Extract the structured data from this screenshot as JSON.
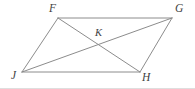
{
  "figure": {
    "background_color": "#ffffff",
    "stroke_color": "#8c8c8c",
    "label_color": "#3f3f3f",
    "stroke_width": 1,
    "width": 195,
    "height": 89
  },
  "labels": {
    "f": "F",
    "g": "G",
    "j": "J",
    "h": "H",
    "k": "K"
  },
  "vertices": {
    "F": {
      "x": 58,
      "y": 18,
      "label": "F",
      "label_x": 49,
      "label_y": 3
    },
    "G": {
      "x": 172,
      "y": 18,
      "label": "G",
      "label_x": 175,
      "label_y": 3
    },
    "J": {
      "x": 22,
      "y": 72,
      "label": "J",
      "label_x": 11,
      "label_y": 71
    },
    "H": {
      "x": 140,
      "y": 72,
      "label": "H",
      "label_x": 142,
      "label_y": 72
    },
    "K": {
      "x": 97,
      "y": 45,
      "label": "K",
      "label_x": 95,
      "label_y": 28
    }
  },
  "segments": [
    {
      "name": "FG",
      "from": "F",
      "to": "G",
      "kind": "side"
    },
    {
      "name": "GH",
      "from": "G",
      "to": "H",
      "kind": "side"
    },
    {
      "name": "HJ",
      "from": "H",
      "to": "J",
      "kind": "side"
    },
    {
      "name": "JF",
      "from": "J",
      "to": "F",
      "kind": "side"
    },
    {
      "name": "FH",
      "from": "F",
      "to": "H",
      "kind": "diagonal"
    },
    {
      "name": "JG",
      "from": "J",
      "to": "G",
      "kind": "diagonal"
    }
  ],
  "baseline_artifact": true
}
